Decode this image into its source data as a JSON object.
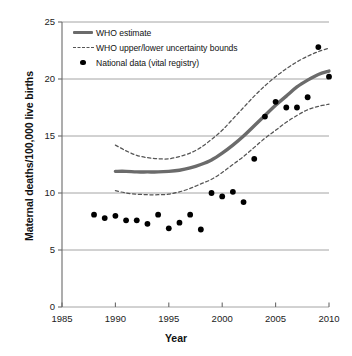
{
  "chart_data": {
    "type": "line",
    "title": "",
    "xlabel": "Year",
    "ylabel": "Maternal deaths/100,000 live births",
    "xlim": [
      1985,
      2010
    ],
    "ylim": [
      0,
      25
    ],
    "xticks": [
      "1985",
      "1990",
      "1995",
      "2000",
      "2005",
      "2010"
    ],
    "yticks": [
      "0",
      "5",
      "10",
      "15",
      "20",
      "25"
    ],
    "grid": "horizontal",
    "legend_position": "top-left-inside",
    "series": [
      {
        "name": "WHO estimate",
        "style": "solid",
        "color": "#6b6b6b",
        "x": [
          1990,
          1991,
          1992,
          1993,
          1994,
          1995,
          1996,
          1997,
          1998,
          1999,
          2000,
          2001,
          2002,
          2003,
          2004,
          2005,
          2006,
          2007,
          2008,
          2009,
          2010
        ],
        "values": [
          11.9,
          11.9,
          11.85,
          11.85,
          11.85,
          11.9,
          12.0,
          12.2,
          12.5,
          12.9,
          13.5,
          14.2,
          15.0,
          15.9,
          16.8,
          17.7,
          18.5,
          19.3,
          19.9,
          20.4,
          20.7
        ]
      },
      {
        "name": "WHO upper uncertainty bound",
        "style": "dashed",
        "color": "#555555",
        "x": [
          1990,
          1991,
          1992,
          1993,
          1994,
          1995,
          1996,
          1997,
          1998,
          1999,
          2000,
          2001,
          2002,
          2003,
          2004,
          2005,
          2006,
          2007,
          2008,
          2009,
          2010
        ],
        "values": [
          14.2,
          13.7,
          13.3,
          13.1,
          13.0,
          13.0,
          13.2,
          13.5,
          14.0,
          14.7,
          15.5,
          16.5,
          17.5,
          18.5,
          19.4,
          20.2,
          20.9,
          21.5,
          22.0,
          22.4,
          22.7
        ]
      },
      {
        "name": "WHO lower uncertainty bound",
        "style": "dashed",
        "color": "#555555",
        "x": [
          1990,
          1991,
          1992,
          1993,
          1994,
          1995,
          1996,
          1997,
          1998,
          1999,
          2000,
          2001,
          2002,
          2003,
          2004,
          2005,
          2006,
          2007,
          2008,
          2009,
          2010
        ],
        "values": [
          10.2,
          10.0,
          9.9,
          9.85,
          9.85,
          9.9,
          10.1,
          10.4,
          10.8,
          11.2,
          11.8,
          12.5,
          13.2,
          14.0,
          14.8,
          15.5,
          16.2,
          16.8,
          17.3,
          17.6,
          17.8
        ]
      },
      {
        "name": "National data (vital registry)",
        "style": "scatter",
        "color": "#000000",
        "x": [
          1988,
          1989,
          1990,
          1991,
          1992,
          1993,
          1994,
          1995,
          1996,
          1997,
          1998,
          1999,
          2000,
          2001,
          2002,
          2003,
          2004,
          2005,
          2006,
          2007,
          2008,
          2009,
          2010
        ],
        "values": [
          8.1,
          7.8,
          8.0,
          7.6,
          7.6,
          7.3,
          8.1,
          6.9,
          7.4,
          8.1,
          6.8,
          10.0,
          9.7,
          10.1,
          9.2,
          13.0,
          16.7,
          18.0,
          17.5,
          17.5,
          18.4,
          22.8,
          20.2
        ]
      }
    ]
  },
  "legend": {
    "items": [
      {
        "label": "WHO estimate",
        "key": "solid-line-key"
      },
      {
        "label": "WHO upper/lower uncertainty bounds",
        "key": "dashed-line-key"
      },
      {
        "label": "National data (vital registry)",
        "key": "dot-marker-key"
      }
    ]
  },
  "axes": {
    "x_axis_label": "Year",
    "y_axis_label": "Maternal deaths/100,000 live births"
  }
}
